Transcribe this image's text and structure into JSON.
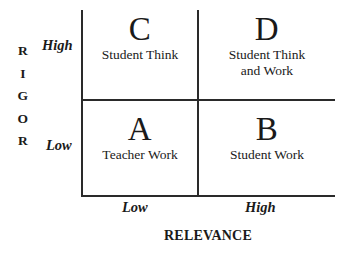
{
  "figure": {
    "type": "2x2-matrix",
    "y_axis": {
      "title": "RIGOR",
      "title_letters": [
        "R",
        "I",
        "G",
        "O",
        "R"
      ],
      "high_label": "High",
      "low_label": "Low"
    },
    "x_axis": {
      "title": "RELEVANCE",
      "low_label": "Low",
      "high_label": "High"
    },
    "quadrants": [
      {
        "key": "C",
        "letter": "C",
        "description": "Student Think",
        "rigor": "High",
        "relevance": "Low"
      },
      {
        "key": "D",
        "letter": "D",
        "description": "Student Think\nand Work",
        "rigor": "High",
        "relevance": "High"
      },
      {
        "key": "A",
        "letter": "A",
        "description": "Teacher Work",
        "rigor": "Low",
        "relevance": "Low"
      },
      {
        "key": "B",
        "letter": "B",
        "description": "Student Work",
        "rigor": "Low",
        "relevance": "High"
      }
    ],
    "colors": {
      "background": "#ffffff",
      "line": "#2a2a2a",
      "text": "#1a1a1a"
    }
  }
}
